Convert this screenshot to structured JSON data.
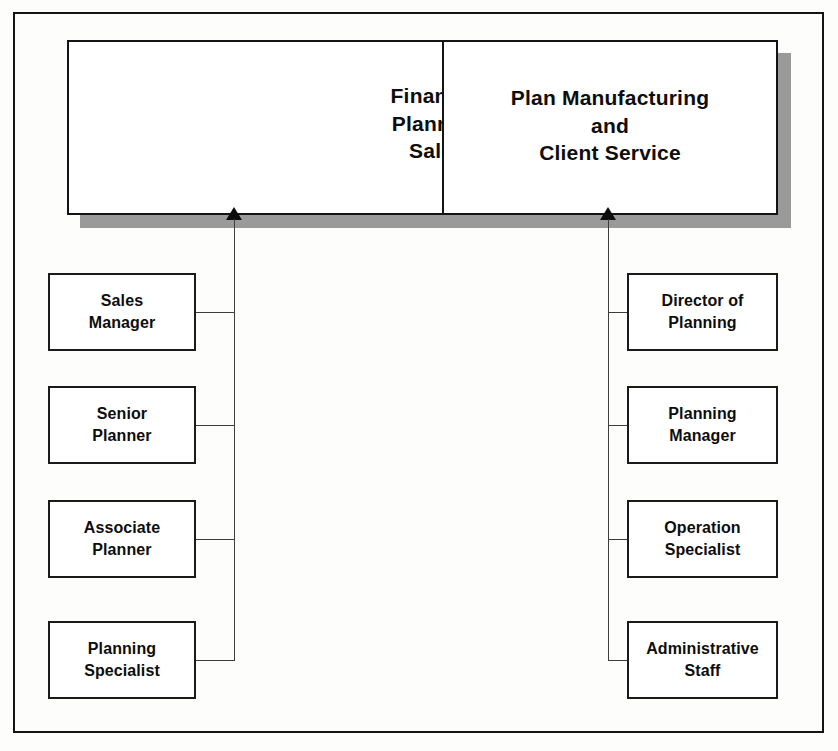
{
  "diagram": {
    "type": "org-chart",
    "frame": {
      "border_color": "#141414"
    },
    "colors": {
      "box_fill": "#ffffff",
      "box_border": "#1a1a1a",
      "shadow": "#9a9a9a",
      "line": "#3d3d3d",
      "text": "#0d0d0d"
    },
    "groups": [
      {
        "id": "financial-planning-sales",
        "header": "Financial\nPlanning\nSales",
        "header_lines": [
          "Financial",
          "Planning",
          "Sales"
        ],
        "units": [
          {
            "id": "sales-manager",
            "label": "Sales\nManager",
            "lines": [
              "Sales",
              "Manager"
            ]
          },
          {
            "id": "senior-planner",
            "label": "Senior\nPlanner",
            "lines": [
              "Senior",
              "Planner"
            ]
          },
          {
            "id": "associate-planner",
            "label": "Associate\nPlanner",
            "lines": [
              "Associate",
              "Planner"
            ]
          },
          {
            "id": "planning-specialist",
            "label": "Planning\nSpecialist",
            "lines": [
              "Planning",
              "Specialist"
            ]
          }
        ]
      },
      {
        "id": "plan-manufacturing-client-service",
        "header": "Plan Manufacturing\nand\nClient Service",
        "header_lines": [
          "Plan Manufacturing",
          "and",
          "Client Service"
        ],
        "units": [
          {
            "id": "director-of-planning",
            "label": "Director of\nPlanning",
            "lines": [
              "Director of",
              "Planning"
            ]
          },
          {
            "id": "planning-manager",
            "label": "Planning\nManager",
            "lines": [
              "Planning",
              "Manager"
            ]
          },
          {
            "id": "operation-specialist",
            "label": "Operation\nSpecialist",
            "lines": [
              "Operation",
              "Specialist"
            ]
          },
          {
            "id": "administrative-staff",
            "label": "Administrative\nStaff",
            "lines": [
              "Administrative",
              "Staff"
            ]
          }
        ]
      }
    ]
  }
}
